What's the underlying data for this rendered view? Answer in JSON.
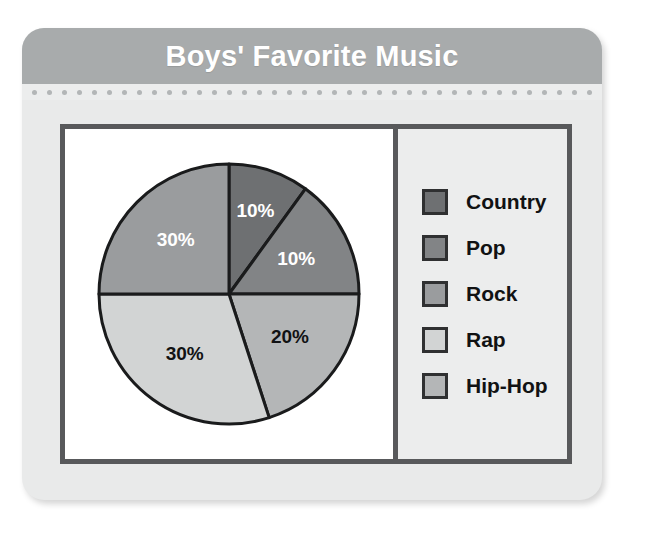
{
  "card": {
    "title": "Boys' Favorite Music"
  },
  "chart_data": {
    "type": "pie",
    "title": "Boys' Favorite Music",
    "categories": [
      "Country",
      "Pop",
      "Rock",
      "Rap",
      "Hip-Hop"
    ],
    "values": [
      10,
      10,
      30,
      30,
      20
    ],
    "value_labels": [
      "10%",
      "10%",
      "30%",
      "30%",
      "20%"
    ],
    "unit": "percent",
    "total": 100,
    "legend_position": "right",
    "grid": false,
    "slice_colors": [
      "#6e7072",
      "#828486",
      "#9a9c9e",
      "#d2d4d4",
      "#b4b6b7"
    ],
    "slices": [
      {
        "name": "Country",
        "value": 10,
        "label": "10%",
        "color": "#6e7072",
        "label_color": "#ffffff",
        "start_deg": 0,
        "end_deg": 36
      },
      {
        "name": "Pop",
        "value": 10,
        "label": "10%",
        "color": "#828486",
        "label_color": "#ffffff",
        "start_deg": 36,
        "end_deg": 90
      },
      {
        "name": "Hip-Hop",
        "value": 20,
        "label": "20%",
        "color": "#b4b6b7",
        "label_color": "#111213",
        "start_deg": 90,
        "end_deg": 162
      },
      {
        "name": "Rap",
        "value": 30,
        "label": "30%",
        "color": "#d2d4d4",
        "label_color": "#111213",
        "start_deg": 162,
        "end_deg": 270
      },
      {
        "name": "Rock",
        "value": 30,
        "label": "30%",
        "color": "#9a9c9e",
        "label_color": "#ffffff",
        "start_deg": 270,
        "end_deg": 360
      }
    ]
  },
  "legend": {
    "items": [
      {
        "label": "Country",
        "color": "#6e7072"
      },
      {
        "label": "Pop",
        "color": "#828486"
      },
      {
        "label": "Rock",
        "color": "#9a9c9e"
      },
      {
        "label": "Rap",
        "color": "#d2d4d4"
      },
      {
        "label": "Hip-Hop",
        "color": "#b4b6b7"
      }
    ]
  },
  "colors": {
    "header_band": "#a8abac",
    "card_body": "#e9eaea",
    "frame_stroke": "#58595b",
    "pie_stroke": "#1a1b1c"
  }
}
